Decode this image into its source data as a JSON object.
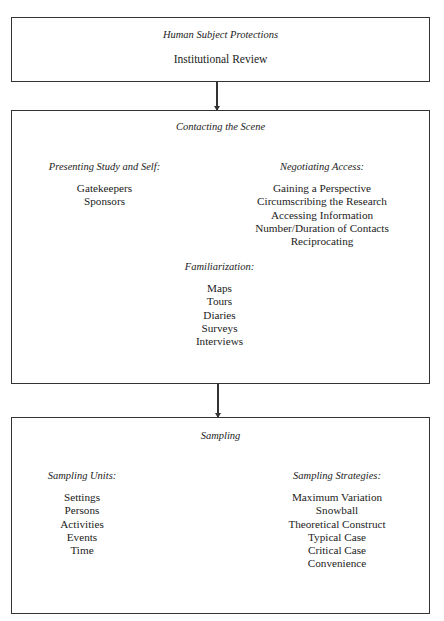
{
  "boxes": {
    "protections": {
      "title": "Human Subject Protections",
      "item": "Institutional Review"
    },
    "contacting": {
      "title": "Contacting the Scene",
      "presenting": {
        "heading": "Presenting Study and Self:",
        "items": [
          "Gatekeepers",
          "Sponsors"
        ]
      },
      "negotiating": {
        "heading": "Negotiating Access:",
        "items": [
          "Gaining a Perspective",
          "Circumscribing the Research",
          "Accessing Information",
          "Number/Duration of Contacts",
          "Reciprocating"
        ]
      },
      "familiarization": {
        "heading": "Familiarization:",
        "items": [
          "Maps",
          "Tours",
          "Diaries",
          "Surveys",
          "Interviews"
        ]
      }
    },
    "sampling": {
      "title": "Sampling",
      "units": {
        "heading": "Sampling Units:",
        "items": [
          "Settings",
          "Persons",
          "Activities",
          "Events",
          "Time"
        ]
      },
      "strategies": {
        "heading": "Sampling Strategies:",
        "items": [
          "Maximum Variation",
          "Snowball",
          "Theoretical Construct",
          "Typical Case",
          "Critical Case",
          "Convenience"
        ]
      }
    }
  },
  "colors": {
    "border": "#333333",
    "text": "#222222",
    "background": "#ffffff"
  }
}
